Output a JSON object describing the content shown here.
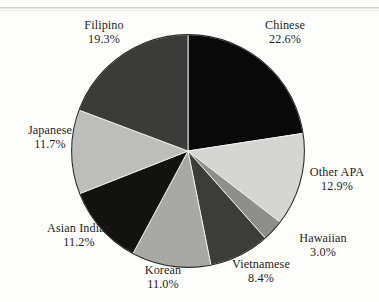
{
  "chart_data": {
    "type": "pie",
    "title": "",
    "subtitle": "",
    "xlabel": "",
    "ylabel": "",
    "legend_position": "outside-labels",
    "grid": false,
    "start_angle_deg": 0,
    "direction": "clockwise",
    "units": "percent",
    "categories": [
      "Chinese",
      "Other APA",
      "Hawaiian",
      "Vietnamese",
      "Korean",
      "Asian Indian",
      "Japanese",
      "Filipino"
    ],
    "values": [
      22.6,
      12.9,
      3.0,
      8.4,
      11.0,
      11.2,
      11.7,
      19.3
    ],
    "slices": [
      {
        "label": "Chinese",
        "percent": 22.6,
        "percent_text": "22.6%",
        "color": "#090909"
      },
      {
        "label": "Other APA",
        "percent": 12.9,
        "percent_text": "12.9%",
        "color": "#d5d5d3"
      },
      {
        "label": "Hawaiian",
        "percent": 3.0,
        "percent_text": "3.0%",
        "color": "#8e8e8c"
      },
      {
        "label": "Vietnamese",
        "percent": 8.4,
        "percent_text": "8.4%",
        "color": "#3c3c3a"
      },
      {
        "label": "Korean",
        "percent": 11.0,
        "percent_text": "11.0%",
        "color": "#a8a8a6"
      },
      {
        "label": "Asian Indian",
        "percent": 11.2,
        "percent_text": "11.2%",
        "color": "#121211"
      },
      {
        "label": "Japanese",
        "percent": 11.7,
        "percent_text": "11.7%",
        "color": "#bdbdbb"
      },
      {
        "label": "Filipino",
        "percent": 19.3,
        "percent_text": "19.3%",
        "color": "#3b3b39"
      }
    ]
  },
  "labels": {
    "filipino": {
      "name": "Filipino",
      "percent": "19.3%"
    },
    "chinese": {
      "name": "Chinese",
      "percent": "22.6%"
    },
    "japanese": {
      "name": "Japanese",
      "percent": "11.7%"
    },
    "other_apa": {
      "name": "Other APA",
      "percent": "12.9%"
    },
    "asian_indian": {
      "name": "Asian Indian",
      "percent": "11.2%"
    },
    "hawaiian": {
      "name": "Hawaiian",
      "percent": "3.0%"
    },
    "korean": {
      "name": "Korean",
      "percent": "11.0%"
    },
    "vietnamese": {
      "name": "Vietnamese",
      "percent": "8.4%"
    }
  },
  "colors": {
    "background": "#fdfdfc",
    "text": "#1d1d1d",
    "outline": "#2a2a2a"
  }
}
